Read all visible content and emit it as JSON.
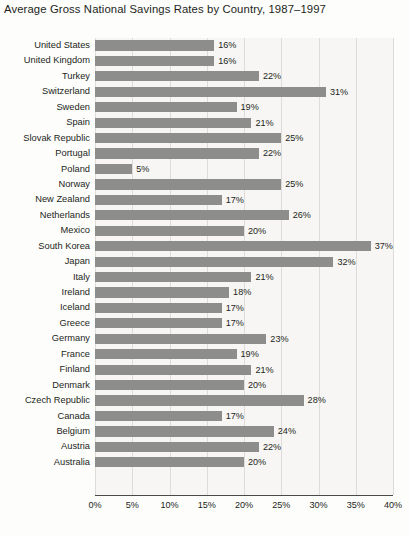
{
  "chart_data": {
    "type": "bar",
    "orientation": "horizontal",
    "title": "Average Gross National Savings Rates by Country, 1987–1997",
    "xlabel": "",
    "ylabel": "",
    "xlim": [
      0,
      40
    ],
    "xtick_labels": [
      "0%",
      "5%",
      "10%",
      "15%",
      "20%",
      "25%",
      "30%",
      "35%",
      "40%"
    ],
    "xtick_values": [
      0,
      5,
      10,
      15,
      20,
      25,
      30,
      35,
      40
    ],
    "grid": "vertical",
    "legend": "none",
    "value_suffix": "%",
    "bar_color": "#8d8d8b",
    "plot_background": "#f7f6f4",
    "gridline_color": "#dddcd9",
    "axis_color": "#4a4a48",
    "categories": [
      "United States",
      "United Kingdom",
      "Turkey",
      "Switzerland",
      "Sweden",
      "Spain",
      "Slovak Republic",
      "Portugal",
      "Poland",
      "Norway",
      "New Zealand",
      "Netherlands",
      "Mexico",
      "South Korea",
      "Japan",
      "Italy",
      "Ireland",
      "Iceland",
      "Greece",
      "Germany",
      "France",
      "Finland",
      "Denmark",
      "Czech Republic",
      "Canada",
      "Belgium",
      "Austria",
      "Australia"
    ],
    "values": [
      16,
      16,
      22,
      31,
      19,
      21,
      25,
      22,
      5,
      25,
      17,
      26,
      20,
      37,
      32,
      21,
      18,
      17,
      17,
      23,
      19,
      21,
      20,
      28,
      17,
      24,
      22,
      20
    ],
    "value_labels": [
      "16%",
      "16%",
      "22%",
      "31%",
      "19%",
      "21%",
      "25%",
      "22%",
      "5%",
      "25%",
      "17%",
      "26%",
      "20%",
      "37%",
      "32%",
      "21%",
      "18%",
      "17%",
      "17%",
      "23%",
      "19%",
      "21%",
      "20%",
      "28%",
      "17%",
      "24%",
      "22%",
      "20%"
    ]
  }
}
